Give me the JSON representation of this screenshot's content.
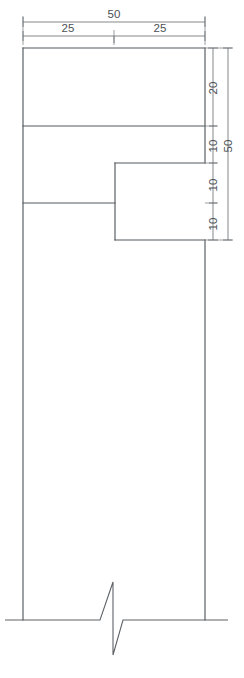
{
  "drawing": {
    "title": "Stepped Profile Section View",
    "units": "mm",
    "line_color": "#555a5e",
    "dim_color": "#6d7276",
    "background": "#ffffff",
    "view_type": "orthographic-section-with-break"
  },
  "dimensions": {
    "horizontal": {
      "overall": {
        "value": "50",
        "x_start": 23,
        "x_end": 205,
        "line_y": 22,
        "label_x": 114,
        "label_y": 18
      },
      "segments": [
        {
          "value": "25",
          "x_start": 23,
          "x_end": 114,
          "line_y": 36,
          "label_x": 68,
          "label_y": 32
        },
        {
          "value": "25",
          "x_start": 114,
          "x_end": 205,
          "line_y": 36,
          "label_x": 160,
          "label_y": 32
        }
      ]
    },
    "vertical": {
      "chain_x": 213,
      "overall_x": 228,
      "overall": {
        "value": "50",
        "y_start": 48,
        "y_end": 240,
        "label_y": 146
      },
      "segments": [
        {
          "value": "20",
          "y_start": 48,
          "y_end": 126,
          "label_y": 88
        },
        {
          "value": "10",
          "y_start": 126,
          "y_end": 163,
          "label_y": 146
        },
        {
          "value": "10",
          "y_start": 163,
          "y_end": 203,
          "label_y": 185
        },
        {
          "value": "10",
          "y_start": 203,
          "y_end": 240,
          "label_y": 224
        }
      ]
    }
  },
  "geometry": {
    "outline": {
      "left_x": 23,
      "right_x": 205,
      "top_y": 48,
      "break_y": 620,
      "step_x": 115,
      "step_top_y": 163,
      "step_bottom_y": 240
    },
    "internal_lines": [
      {
        "name": "upper-divider",
        "x1": 23,
        "y1": 126,
        "x2": 205,
        "y2": 126
      },
      {
        "name": "step-top-edge",
        "x1": 115,
        "y1": 163,
        "x2": 205,
        "y2": 163
      },
      {
        "name": "mid-divider",
        "x1": 23,
        "y1": 203,
        "x2": 115,
        "y2": 203
      },
      {
        "name": "step-bottom-edge",
        "x1": 115,
        "y1": 240,
        "x2": 205,
        "y2": 240
      },
      {
        "name": "step-vertical",
        "x1": 115,
        "y1": 163,
        "x2": 115,
        "y2": 240
      }
    ],
    "break_symbol": {
      "name": "zigzag-break",
      "baseline_y": 620,
      "left_end_x": 5,
      "right_end_x": 228,
      "apex_top": {
        "x": 113,
        "y": 582
      },
      "apex_bottom": {
        "x": 113,
        "y": 655
      },
      "left_kink_x": 100,
      "right_kink_x": 123
    }
  }
}
